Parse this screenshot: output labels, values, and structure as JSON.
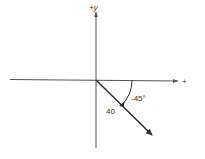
{
  "diagram": {
    "type": "vector-diagram",
    "axes": {
      "y_label": "+y",
      "x_label": "+"
    },
    "vector": {
      "magnitude_label": "40",
      "angle_label": "-45°",
      "magnitude": 40,
      "angle_deg": -45
    },
    "colors": {
      "line": "#333333",
      "background": "#ffffff"
    }
  }
}
